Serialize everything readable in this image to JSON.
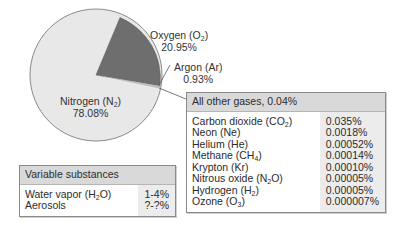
{
  "chart_data": {
    "type": "pie",
    "title": "",
    "slices": [
      {
        "label": "Nitrogen (N2)",
        "value": 78.08,
        "display": "78.08%",
        "color": "#e6e6e6"
      },
      {
        "label": "Oxygen (O2)",
        "value": 20.95,
        "display": "20.95%",
        "color": "#6b6b6b"
      },
      {
        "label": "Argon (Ar)",
        "value": 0.93,
        "display": "0.93%",
        "color": "#e6e6e6"
      },
      {
        "label": "All other gases",
        "value": 0.04,
        "display": "0.04%",
        "color": "#e6e6e6"
      }
    ],
    "other_gases_table": {
      "title": "All other gases, 0.04%",
      "rows": [
        {
          "name": "Carbon dioxide (CO2)",
          "value": "0.035%"
        },
        {
          "name": "Neon (Ne)",
          "value": "0.0018%"
        },
        {
          "name": "Helium (He)",
          "value": "0.00052%"
        },
        {
          "name": "Methane (CH4)",
          "value": "0.00014%"
        },
        {
          "name": "Krypton (Kr)",
          "value": "0.00010%"
        },
        {
          "name": "Nitrous oxide (N2O)",
          "value": "0.00005%"
        },
        {
          "name": "Hydrogen (H2)",
          "value": "0.00005%"
        },
        {
          "name": "Ozone (O3)",
          "value": "0.000007%"
        }
      ]
    },
    "variable_table": {
      "title": "Variable substances",
      "rows": [
        {
          "name": "Water vapor (H2O)",
          "value": "1-4%"
        },
        {
          "name": "Aerosols",
          "value": "?-?%"
        }
      ]
    }
  },
  "labels": {
    "nitrogen": {
      "name": "Nitrogen (N",
      "sub": "2",
      "close": ")",
      "pct": "78.08%"
    },
    "oxygen": {
      "name": "Oxygen (O",
      "sub": "2",
      "close": ")",
      "pct": "20.95%"
    },
    "argon": {
      "name": "Argon (Ar)",
      "pct": "0.93%"
    }
  },
  "others": {
    "title": "All other gases, 0.04%",
    "rows": [
      {
        "pre": "Carbon dioxide (CO",
        "sub": "2",
        "post": ")",
        "value": "0.035%"
      },
      {
        "pre": "Neon (Ne)",
        "sub": "",
        "post": "",
        "value": "0.0018%"
      },
      {
        "pre": "Helium (He)",
        "sub": "",
        "post": "",
        "value": "0.00052%"
      },
      {
        "pre": "Methane (CH",
        "sub": "4",
        "post": ")",
        "value": "0.00014%"
      },
      {
        "pre": "Krypton (Kr)",
        "sub": "",
        "post": "",
        "value": "0.00010%"
      },
      {
        "pre": "Nitrous oxide (N",
        "sub": "2",
        "post": "O)",
        "value": "0.00005%"
      },
      {
        "pre": "Hydrogen (H",
        "sub": "2",
        "post": ")",
        "value": "0.00005%"
      },
      {
        "pre": "Ozone (O",
        "sub": "3",
        "post": ")",
        "value": "0.000007%"
      }
    ]
  },
  "variable": {
    "title": "Variable substances",
    "rows": [
      {
        "pre": "Water vapor (H",
        "sub": "2",
        "post": "O)",
        "value": "1-4%"
      },
      {
        "pre": "Aerosols",
        "sub": "",
        "post": "",
        "value": "?-?%"
      }
    ]
  }
}
